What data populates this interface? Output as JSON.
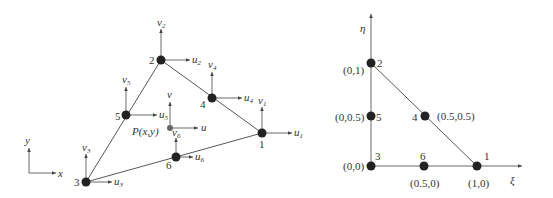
{
  "left_diagram": {
    "title": "Physical triangular element (x, y)",
    "axes": {
      "x_label": "x",
      "y_label": "y"
    },
    "interior_point": {
      "label": "P(x,y)",
      "u_label": "u",
      "v_label": "v"
    },
    "nodes": [
      {
        "id": "1",
        "u": "u",
        "v": "v",
        "sub": "1"
      },
      {
        "id": "2",
        "u": "u",
        "v": "v",
        "sub": "2"
      },
      {
        "id": "3",
        "u": "u",
        "v": "v",
        "sub": "3"
      },
      {
        "id": "4",
        "u": "u",
        "v": "v",
        "sub": "4"
      },
      {
        "id": "5",
        "u": "u",
        "v": "v",
        "sub": "5"
      },
      {
        "id": "6",
        "u": "u",
        "v": "v",
        "sub": "6"
      }
    ]
  },
  "right_diagram": {
    "title": "Natural coordinate element (ξ, η)",
    "axes": {
      "xi_label": "ξ",
      "eta_label": "η"
    },
    "nodes": [
      {
        "id": "1",
        "coord": "(1,0)"
      },
      {
        "id": "2",
        "coord": "(0,1)"
      },
      {
        "id": "3",
        "coord": "(0,0)"
      },
      {
        "id": "4",
        "coord": "(0.5,0.5)"
      },
      {
        "id": "5",
        "coord": "(0,0.5)"
      },
      {
        "id": "6",
        "coord": "(0.5,0)"
      }
    ]
  }
}
